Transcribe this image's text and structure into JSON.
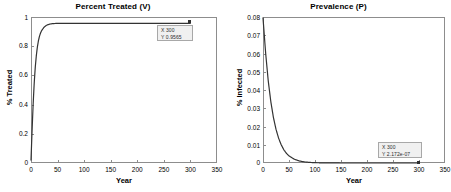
{
  "figure": {
    "background": "#ffffff",
    "axis_color": "#8d8d8d",
    "curve_color": "#333333",
    "text_color": "#000000"
  },
  "panels": [
    {
      "id": "percent-treated",
      "title": "Percent Treated (V)",
      "xlabel": "Year",
      "ylabel": "% Treated",
      "xticks": [
        "0",
        "50",
        "100",
        "150",
        "200",
        "250",
        "300",
        "350"
      ],
      "yticks": [
        "0",
        "0.2",
        "0.4",
        "0.6",
        "0.8",
        "1"
      ],
      "datatip": {
        "x_text": "X 300",
        "y_text": "Y 0.9565"
      }
    },
    {
      "id": "prevalence",
      "title": "Prevalence (P)",
      "xlabel": "Year",
      "ylabel": "% Infected",
      "xticks": [
        "0",
        "50",
        "100",
        "150",
        "200",
        "250",
        "300",
        "350"
      ],
      "yticks": [
        "0",
        "0.01",
        "0.02",
        "0.03",
        "0.04",
        "0.05",
        "0.06",
        "0.07",
        "0.08"
      ],
      "datatip": {
        "x_text": "X 300",
        "y_text": "Y 2.172e-07"
      }
    }
  ],
  "chart_data": [
    {
      "type": "line",
      "title": "Percent Treated (V)",
      "xlabel": "Year",
      "ylabel": "% Treated",
      "xlim": [
        0,
        350
      ],
      "ylim": [
        0,
        1
      ],
      "xticks": [
        0,
        50,
        100,
        150,
        200,
        250,
        300,
        350
      ],
      "yticks": [
        0,
        0.2,
        0.4,
        0.6,
        0.8,
        1
      ],
      "grid": false,
      "legend": null,
      "annotation": {
        "label": "X 300\nY 0.9565",
        "x": 300,
        "y": 0.9565
      },
      "series": [
        {
          "name": "V",
          "color": "#333333",
          "x": [
            0,
            2,
            4,
            6,
            8,
            10,
            12,
            14,
            16,
            18,
            20,
            25,
            30,
            35,
            40,
            45,
            50,
            60,
            70,
            80,
            100,
            120,
            150,
            200,
            250,
            300
          ],
          "y": [
            0.02,
            0.22,
            0.4,
            0.545,
            0.655,
            0.735,
            0.795,
            0.838,
            0.869,
            0.891,
            0.907,
            0.932,
            0.9448,
            0.9512,
            0.9543,
            0.9556,
            0.9561,
            0.9564,
            0.9565,
            0.9565,
            0.9565,
            0.9565,
            0.9565,
            0.9565,
            0.9565,
            0.9565
          ]
        }
      ]
    },
    {
      "type": "line",
      "title": "Prevalence (P)",
      "xlabel": "Year",
      "ylabel": "% Infected",
      "xlim": [
        0,
        350
      ],
      "ylim": [
        0,
        0.08
      ],
      "xticks": [
        0,
        50,
        100,
        150,
        200,
        250,
        300,
        350
      ],
      "yticks": [
        0,
        0.01,
        0.02,
        0.03,
        0.04,
        0.05,
        0.06,
        0.07,
        0.08
      ],
      "grid": false,
      "legend": null,
      "annotation": {
        "label": "X 300\nY 2.172e-07",
        "x": 300,
        "y": 2.172e-07
      },
      "series": [
        {
          "name": "P",
          "color": "#333333",
          "x": [
            0,
            5,
            10,
            15,
            20,
            25,
            30,
            35,
            40,
            45,
            50,
            60,
            70,
            80,
            90,
            100,
            120,
            150,
            200,
            250,
            300
          ],
          "y": [
            0.0795,
            0.0605,
            0.0452,
            0.0337,
            0.025,
            0.0185,
            0.0136,
            0.01,
            0.0073,
            0.0053,
            0.0039,
            0.0021,
            0.0011,
            0.00058,
            0.00031,
            0.00017,
            5e-05,
            1e-05,
            5e-07,
            1e-07,
            2.172e-07
          ]
        }
      ]
    }
  ]
}
